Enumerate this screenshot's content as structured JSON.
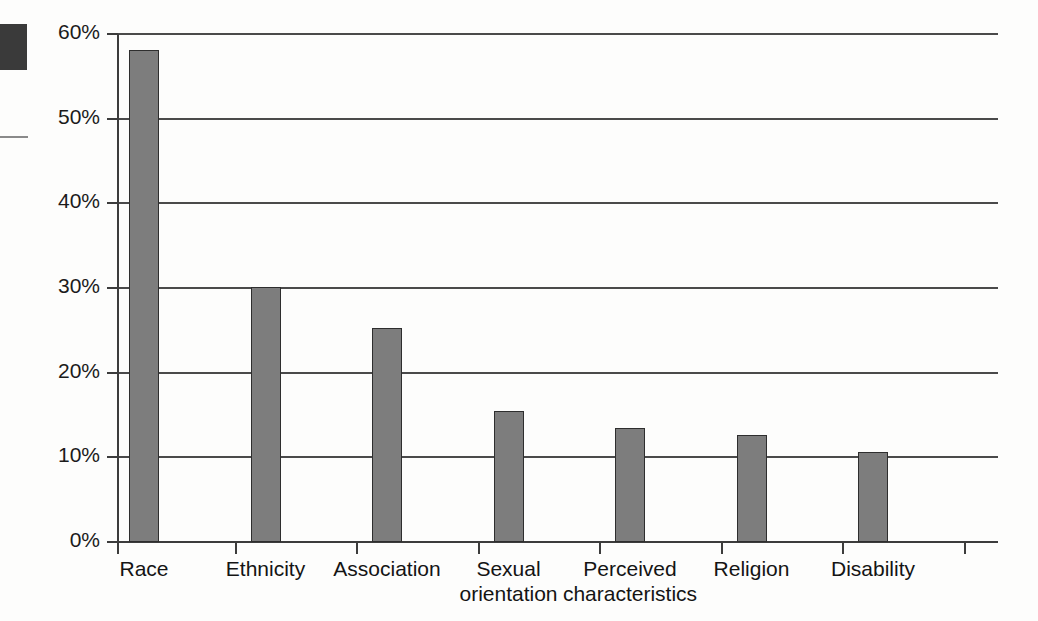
{
  "chart_data": {
    "type": "bar",
    "title": "",
    "xlabel": "",
    "ylabel": "",
    "categories": [
      "Race",
      "Ethnicity",
      "Association",
      "Sexual\norientation",
      "Perceived\ncharacteristics",
      "Religion",
      "Disability"
    ],
    "values": [
      58.1,
      30.1,
      25.3,
      15.5,
      13.5,
      12.6,
      10.6
    ],
    "ylim": [
      0,
      60
    ],
    "y_ticks": [
      0,
      10,
      20,
      30,
      40,
      50,
      60
    ],
    "y_tick_labels": [
      "0%",
      "10%",
      "20%",
      "30%",
      "40%",
      "50%",
      "60%"
    ],
    "grid": true,
    "legend": "none",
    "bar_color": "#7d7d7d",
    "bar_edge_color": "#2e2e2e",
    "axis_color": "#3c3c3c"
  }
}
